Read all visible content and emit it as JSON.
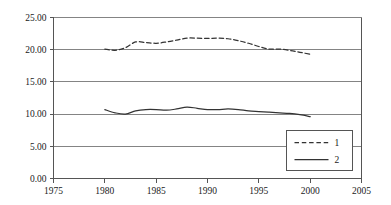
{
  "chart_data": {
    "type": "line",
    "title": "",
    "subtitle": "",
    "xlabel": "",
    "ylabel": "",
    "xlim": [
      1975,
      2005
    ],
    "ylim": [
      0.0,
      25.0
    ],
    "grid": true,
    "grid_axis": "y",
    "legend_position": "bottom-right",
    "x_tick_labels": [
      "1975",
      "1980",
      "1985",
      "1990",
      "1995",
      "2000",
      "2005"
    ],
    "x_ticks": [
      1975,
      1980,
      1985,
      1990,
      1995,
      2000,
      2005
    ],
    "y_tick_labels": [
      "0.00",
      "5.00",
      "10.00",
      "15.00",
      "20.00",
      "25.00"
    ],
    "y_ticks": [
      0.0,
      5.0,
      10.0,
      15.0,
      20.0,
      25.0
    ],
    "x": [
      1980,
      1981,
      1982,
      1983,
      1984,
      1985,
      1986,
      1987,
      1988,
      1989,
      1990,
      1991,
      1992,
      1993,
      1994,
      1995,
      1996,
      1997,
      1998,
      1999,
      2000
    ],
    "series": [
      {
        "name": "1",
        "legend_label": "1",
        "style": "dashed",
        "color": "#333333",
        "values": [
          20.1,
          19.9,
          20.3,
          21.2,
          21.1,
          21.0,
          21.2,
          21.5,
          21.8,
          21.8,
          21.75,
          21.8,
          21.7,
          21.4,
          21.0,
          20.5,
          20.1,
          20.1,
          19.9,
          19.6,
          19.3
        ]
      },
      {
        "name": "2",
        "legend_label": "2",
        "style": "solid",
        "color": "#333333",
        "values": [
          10.7,
          10.2,
          10.0,
          10.5,
          10.7,
          10.7,
          10.6,
          10.8,
          11.1,
          10.9,
          10.7,
          10.7,
          10.8,
          10.7,
          10.5,
          10.4,
          10.3,
          10.2,
          10.1,
          9.9,
          9.6
        ]
      }
    ]
  },
  "legend": {
    "entries": [
      {
        "label": "1",
        "style": "dashed"
      },
      {
        "label": "2",
        "style": "solid"
      }
    ]
  },
  "colors": {
    "axis": "#555555",
    "grid": "#777777",
    "series": "#333333",
    "text": "#1a1a1a",
    "background": "#ffffff"
  }
}
